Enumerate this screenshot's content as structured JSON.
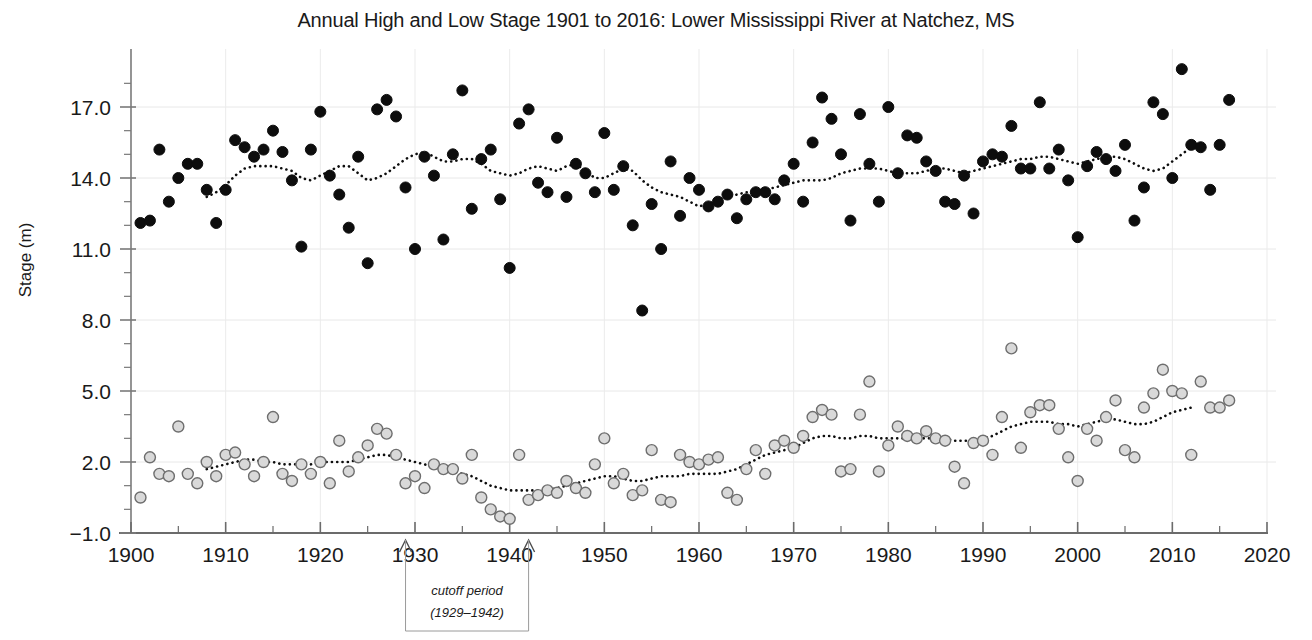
{
  "chart_data": {
    "type": "scatter",
    "title": "Annual High and Low Stage 1901 to 2016: Lower Mississippi River at Natchez, MS",
    "xlabel": "",
    "ylabel": "Stage (m)",
    "xlim": [
      1900,
      2020
    ],
    "ylim": [
      -1.0,
      18.8
    ],
    "grid": true,
    "legend_position": "none",
    "x_ticks": [
      1900,
      1910,
      1920,
      1930,
      1940,
      1950,
      1960,
      1970,
      1980,
      1990,
      2000,
      2010,
      2020
    ],
    "x_tick_labels": [
      "1900",
      "1910",
      "1920",
      "1930",
      "1940",
      "1950",
      "1960",
      "1970",
      "1980",
      "1990",
      "2000",
      "2010",
      "2020"
    ],
    "y_ticks": [
      -1.0,
      2.0,
      5.0,
      8.0,
      11.0,
      14.0,
      17.0
    ],
    "y_tick_labels": [
      "-1.0",
      "2.0",
      "5.0",
      "8.0",
      "11.0",
      "14.0",
      "17.0"
    ],
    "y_minor_tick_step": 1.0,
    "annotations": [
      {
        "name": "cutoff-period",
        "line1": "cutoff period",
        "line2": "(1929–1942)",
        "x_start": 1929,
        "x_end": 1942
      }
    ],
    "series": [
      {
        "name": "Annual High Stage",
        "marker": "filled-circle",
        "marker_color": "#0d0d0d",
        "marker_edge_color": "#0d0d0d",
        "marker_size": 11,
        "x": [
          1901,
          1902,
          1903,
          1904,
          1905,
          1906,
          1907,
          1908,
          1909,
          1910,
          1911,
          1912,
          1913,
          1914,
          1915,
          1916,
          1917,
          1918,
          1919,
          1920,
          1921,
          1922,
          1923,
          1924,
          1925,
          1926,
          1927,
          1928,
          1929,
          1930,
          1931,
          1932,
          1933,
          1934,
          1935,
          1936,
          1937,
          1938,
          1939,
          1940,
          1941,
          1942,
          1943,
          1944,
          1945,
          1946,
          1947,
          1948,
          1949,
          1950,
          1951,
          1952,
          1953,
          1954,
          1955,
          1956,
          1957,
          1958,
          1959,
          1960,
          1961,
          1962,
          1963,
          1964,
          1965,
          1966,
          1967,
          1968,
          1969,
          1970,
          1971,
          1972,
          1973,
          1974,
          1975,
          1976,
          1977,
          1978,
          1979,
          1980,
          1981,
          1982,
          1983,
          1984,
          1985,
          1986,
          1987,
          1988,
          1989,
          1990,
          1991,
          1992,
          1993,
          1994,
          1995,
          1996,
          1997,
          1998,
          1999,
          2000,
          2001,
          2002,
          2003,
          2004,
          2005,
          2006,
          2007,
          2008,
          2009,
          2010,
          2011,
          2012,
          2013,
          2014,
          2015,
          2016
        ],
        "y": [
          12.1,
          12.2,
          15.2,
          13.0,
          14.0,
          14.6,
          14.6,
          13.5,
          12.1,
          13.5,
          15.6,
          15.3,
          14.9,
          15.2,
          16.0,
          15.1,
          13.9,
          11.1,
          15.2,
          16.8,
          14.1,
          13.3,
          11.9,
          14.9,
          10.4,
          16.9,
          17.3,
          16.6,
          13.6,
          11.0,
          14.9,
          14.1,
          11.4,
          15.0,
          17.7,
          12.7,
          14.8,
          15.2,
          13.1,
          10.2,
          16.3,
          16.9,
          13.8,
          13.4,
          15.7,
          13.2,
          14.6,
          14.2,
          13.4,
          15.9,
          13.5,
          14.5,
          12.0,
          8.4,
          12.9,
          11.0,
          14.7,
          12.4,
          14.0,
          13.5,
          12.8,
          13.0,
          13.3,
          12.3,
          13.1,
          13.4,
          13.4,
          13.1,
          13.9,
          14.6,
          13.0,
          15.5,
          17.4,
          16.5,
          15.0,
          12.2,
          16.7,
          14.6,
          13.0,
          17.0,
          14.2,
          15.8,
          15.7,
          14.7,
          14.3,
          13.0,
          12.9,
          14.1,
          12.5,
          14.7,
          15.0,
          14.9,
          16.2,
          14.4,
          14.4,
          17.2,
          14.4,
          15.2,
          13.9,
          11.5,
          14.5,
          15.1,
          14.8,
          14.3,
          15.4,
          12.2,
          13.6,
          17.2,
          16.7,
          14.0,
          18.6,
          15.4,
          15.3,
          13.5,
          15.4,
          17.3
        ]
      },
      {
        "name": "Annual Low Stage",
        "marker": "open-circle",
        "marker_color": "#d9d9d9",
        "marker_edge_color": "#6e6e6e",
        "marker_size": 11,
        "x": [
          1901,
          1902,
          1903,
          1904,
          1905,
          1906,
          1907,
          1908,
          1909,
          1910,
          1911,
          1912,
          1913,
          1914,
          1915,
          1916,
          1917,
          1918,
          1919,
          1920,
          1921,
          1922,
          1923,
          1924,
          1925,
          1926,
          1927,
          1928,
          1929,
          1930,
          1931,
          1932,
          1933,
          1934,
          1935,
          1936,
          1937,
          1938,
          1939,
          1940,
          1941,
          1942,
          1943,
          1944,
          1945,
          1946,
          1947,
          1948,
          1949,
          1950,
          1951,
          1952,
          1953,
          1954,
          1955,
          1956,
          1957,
          1958,
          1959,
          1960,
          1961,
          1962,
          1963,
          1964,
          1965,
          1966,
          1967,
          1968,
          1969,
          1970,
          1971,
          1972,
          1973,
          1974,
          1975,
          1976,
          1977,
          1978,
          1979,
          1980,
          1981,
          1982,
          1983,
          1984,
          1985,
          1986,
          1987,
          1988,
          1989,
          1990,
          1991,
          1992,
          1993,
          1994,
          1995,
          1996,
          1997,
          1998,
          1999,
          2000,
          2001,
          2002,
          2003,
          2004,
          2005,
          2006,
          2007,
          2008,
          2009,
          2010,
          2011,
          2012,
          2013,
          2014,
          2015,
          2016
        ],
        "y": [
          0.5,
          2.2,
          1.5,
          1.4,
          3.5,
          1.5,
          1.1,
          2.0,
          1.4,
          2.3,
          2.4,
          1.9,
          1.4,
          2.0,
          3.9,
          1.5,
          1.2,
          1.9,
          1.5,
          2.0,
          1.1,
          2.9,
          1.6,
          2.2,
          2.7,
          3.4,
          3.2,
          2.3,
          1.1,
          1.4,
          0.9,
          1.9,
          1.7,
          1.7,
          1.3,
          2.3,
          0.5,
          0.0,
          -0.3,
          -0.4,
          2.3,
          0.4,
          0.6,
          0.8,
          0.7,
          1.2,
          0.9,
          0.7,
          1.9,
          3.0,
          1.1,
          1.5,
          0.6,
          0.8,
          2.5,
          0.4,
          0.3,
          2.3,
          2.0,
          1.9,
          2.1,
          2.2,
          0.7,
          0.4,
          1.7,
          2.5,
          1.5,
          2.7,
          2.9,
          2.6,
          3.1,
          3.9,
          4.2,
          4.0,
          1.6,
          1.7,
          4.0,
          5.4,
          1.6,
          2.7,
          3.5,
          3.1,
          3.0,
          3.3,
          3.0,
          2.9,
          1.8,
          1.1,
          2.8,
          2.9,
          2.3,
          3.9,
          6.8,
          2.6,
          4.1,
          4.4,
          4.4,
          3.4,
          2.2,
          1.2,
          3.4,
          2.9,
          3.9,
          4.6,
          2.5,
          2.2,
          4.3,
          4.9,
          5.9,
          5.0,
          4.9,
          2.3,
          5.4,
          4.3,
          4.3,
          4.6
        ]
      }
    ],
    "trend_lines": [
      {
        "name": "High stage trend (moving average)",
        "style": "dotted",
        "color": "#0d0d0d",
        "x": [
          1908,
          1909,
          1910,
          1911,
          1912,
          1913,
          1914,
          1915,
          1916,
          1917,
          1918,
          1919,
          1920,
          1921,
          1922,
          1923,
          1924,
          1925,
          1926,
          1927,
          1928,
          1929,
          1930,
          1931,
          1932,
          1933,
          1934,
          1935,
          1936,
          1937,
          1938,
          1939,
          1940,
          1941,
          1942,
          1943,
          1944,
          1945,
          1946,
          1947,
          1948,
          1949,
          1950,
          1951,
          1952,
          1953,
          1954,
          1955,
          1956,
          1957,
          1958,
          1959,
          1960,
          1961,
          1962,
          1963,
          1964,
          1965,
          1966,
          1967,
          1968,
          1969,
          1970,
          1971,
          1972,
          1973,
          1974,
          1975,
          1976,
          1977,
          1978,
          1979,
          1980,
          1981,
          1982,
          1983,
          1984,
          1985,
          1986,
          1987,
          1988,
          1989,
          1990,
          1991,
          1992,
          1993,
          1994,
          1995,
          1996,
          1997,
          1998,
          1999,
          2000,
          2001,
          2002,
          2003,
          2004,
          2005,
          2006,
          2007,
          2008,
          2009,
          2010,
          2011,
          2012
        ],
        "y": [
          13.2,
          13.4,
          13.7,
          14.1,
          14.4,
          14.5,
          14.5,
          14.5,
          14.4,
          14.3,
          14.0,
          13.9,
          14.1,
          14.3,
          14.5,
          14.5,
          14.2,
          13.9,
          14.0,
          14.2,
          14.5,
          14.8,
          15.0,
          15.1,
          14.9,
          14.7,
          14.7,
          14.8,
          14.8,
          14.6,
          14.3,
          14.2,
          14.1,
          14.2,
          14.4,
          14.5,
          14.4,
          14.3,
          14.5,
          14.6,
          14.3,
          14.0,
          14.0,
          14.2,
          14.4,
          14.3,
          13.9,
          13.6,
          13.4,
          13.3,
          13.2,
          13.0,
          12.8,
          12.9,
          13.1,
          13.2,
          13.3,
          13.4,
          13.4,
          13.5,
          13.6,
          13.7,
          13.8,
          13.9,
          13.9,
          13.9,
          14.0,
          14.2,
          14.3,
          14.4,
          14.4,
          14.4,
          14.3,
          14.2,
          14.2,
          14.2,
          14.3,
          14.4,
          14.4,
          14.3,
          14.2,
          14.3,
          14.4,
          14.5,
          14.6,
          14.7,
          14.8,
          14.8,
          14.9,
          14.9,
          14.8,
          14.7,
          14.6,
          14.7,
          14.8,
          14.9,
          14.9,
          14.8,
          14.6,
          14.4,
          14.3,
          14.4,
          14.7,
          15.0,
          15.3
        ]
      },
      {
        "name": "Low stage trend (moving average)",
        "style": "dotted",
        "color": "#0d0d0d",
        "x": [
          1908,
          1909,
          1910,
          1911,
          1912,
          1913,
          1914,
          1915,
          1916,
          1917,
          1918,
          1919,
          1920,
          1921,
          1922,
          1923,
          1924,
          1925,
          1926,
          1927,
          1928,
          1929,
          1930,
          1931,
          1932,
          1933,
          1934,
          1935,
          1936,
          1937,
          1938,
          1939,
          1940,
          1941,
          1942,
          1943,
          1944,
          1945,
          1946,
          1947,
          1948,
          1949,
          1950,
          1951,
          1952,
          1953,
          1954,
          1955,
          1956,
          1957,
          1958,
          1959,
          1960,
          1961,
          1962,
          1963,
          1964,
          1965,
          1966,
          1967,
          1968,
          1969,
          1970,
          1971,
          1972,
          1973,
          1974,
          1975,
          1976,
          1977,
          1978,
          1979,
          1980,
          1981,
          1982,
          1983,
          1984,
          1985,
          1986,
          1987,
          1988,
          1989,
          1990,
          1991,
          1992,
          1993,
          1994,
          1995,
          1996,
          1997,
          1998,
          1999,
          2000,
          2001,
          2002,
          2003,
          2004,
          2005,
          2006,
          2007,
          2008,
          2009,
          2010,
          2011,
          2012
        ],
        "y": [
          1.7,
          1.8,
          1.9,
          2.0,
          2.1,
          2.1,
          2.0,
          2.0,
          1.9,
          1.9,
          1.9,
          1.9,
          2.0,
          2.0,
          2.0,
          2.0,
          2.1,
          2.2,
          2.3,
          2.3,
          2.2,
          2.1,
          2.0,
          1.9,
          1.8,
          1.7,
          1.6,
          1.5,
          1.4,
          1.2,
          1.0,
          0.9,
          0.8,
          0.8,
          0.8,
          0.8,
          0.8,
          0.9,
          1.0,
          1.1,
          1.2,
          1.3,
          1.4,
          1.4,
          1.3,
          1.2,
          1.2,
          1.3,
          1.4,
          1.4,
          1.4,
          1.5,
          1.5,
          1.5,
          1.5,
          1.6,
          1.7,
          1.9,
          2.1,
          2.3,
          2.4,
          2.5,
          2.6,
          2.8,
          3.0,
          3.1,
          3.1,
          3.0,
          3.0,
          3.1,
          3.1,
          3.0,
          3.0,
          3.0,
          3.0,
          3.0,
          3.0,
          3.0,
          3.0,
          2.9,
          2.9,
          2.9,
          3.0,
          3.1,
          3.3,
          3.5,
          3.6,
          3.7,
          3.7,
          3.7,
          3.6,
          3.6,
          3.5,
          3.6,
          3.7,
          3.8,
          3.8,
          3.7,
          3.6,
          3.6,
          3.7,
          3.9,
          4.1,
          4.2,
          4.3
        ]
      }
    ]
  }
}
